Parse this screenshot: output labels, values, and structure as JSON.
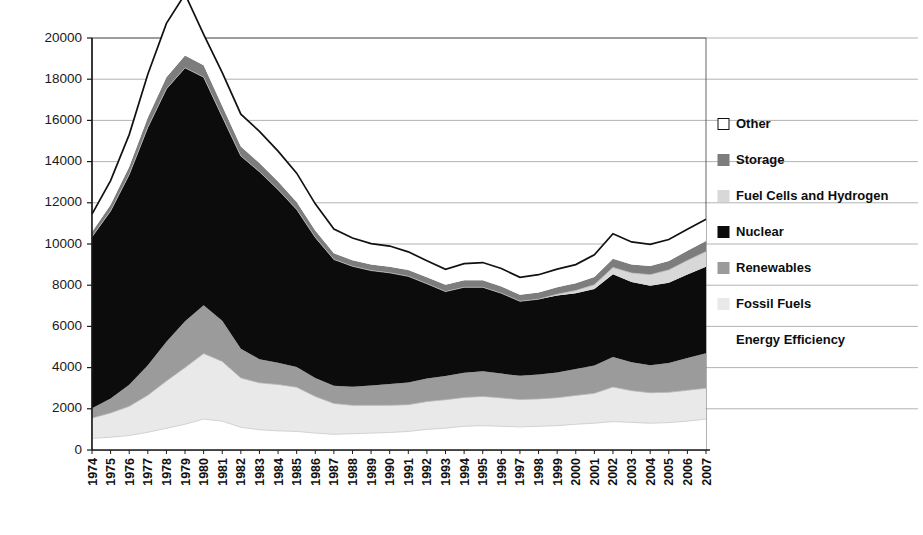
{
  "chart_data": {
    "type": "area",
    "stacked": true,
    "title": "",
    "subtitle": "",
    "xlabel": "",
    "ylabel": "",
    "xlim": [
      1974,
      2007
    ],
    "ylim": [
      0,
      20000
    ],
    "yticks": [
      0,
      2000,
      4000,
      6000,
      8000,
      10000,
      12000,
      14000,
      16000,
      18000,
      20000
    ],
    "ytick_labels": [
      "0",
      "2000",
      "4000",
      "6000",
      "8000",
      "10000",
      "12000",
      "14000",
      "16000",
      "18000",
      "20000"
    ],
    "grid": true,
    "grid_axis": "y",
    "legend_position": "right",
    "categories": [
      1974,
      1975,
      1976,
      1977,
      1978,
      1979,
      1980,
      1981,
      1982,
      1983,
      1984,
      1985,
      1986,
      1987,
      1988,
      1989,
      1990,
      1991,
      1992,
      1993,
      1994,
      1995,
      1996,
      1997,
      1998,
      1999,
      2000,
      2001,
      2002,
      2003,
      2004,
      2005,
      2006,
      2007
    ],
    "xtick_labels": [
      "1974",
      "1975",
      "1976",
      "1977",
      "1978",
      "1979",
      "1980",
      "1981",
      "1982",
      "1983",
      "1984",
      "1985",
      "1986",
      "1987",
      "1988",
      "1989",
      "1990",
      "1991",
      "1992",
      "1993",
      "1994",
      "1995",
      "1996",
      "1997",
      "1998",
      "1999",
      "2000",
      "2001",
      "2002",
      "2003",
      "2004",
      "2005",
      "2006",
      "2007"
    ],
    "stack_order_bottom_to_top": [
      "Energy Efficiency",
      "Fossil Fuels",
      "Renewables",
      "Nuclear",
      "Fuel Cells and Hydrogen",
      "Storage",
      "Other"
    ],
    "series": [
      {
        "name": "Energy Efficiency",
        "color": "#ffffff",
        "values": [
          560,
          620,
          700,
          860,
          1050,
          1250,
          1500,
          1400,
          1100,
          980,
          930,
          900,
          820,
          760,
          790,
          820,
          850,
          900,
          1000,
          1060,
          1150,
          1180,
          1150,
          1120,
          1150,
          1180,
          1250,
          1300,
          1380,
          1340,
          1300,
          1330,
          1400,
          1500
        ]
      },
      {
        "name": "Fossil Fuels",
        "color": "#e9e9e9",
        "values": [
          990,
          1180,
          1420,
          1800,
          2300,
          2750,
          3180,
          2900,
          2400,
          2280,
          2250,
          2150,
          1780,
          1500,
          1380,
          1350,
          1320,
          1300,
          1350,
          1380,
          1400,
          1420,
          1380,
          1330,
          1330,
          1360,
          1400,
          1450,
          1680,
          1540,
          1480,
          1470,
          1500,
          1500
        ]
      },
      {
        "name": "Renewables",
        "color": "#9b9b9b",
        "values": [
          480,
          700,
          1050,
          1450,
          1900,
          2250,
          2350,
          1980,
          1420,
          1150,
          1060,
          980,
          900,
          860,
          900,
          960,
          1030,
          1080,
          1120,
          1150,
          1200,
          1220,
          1180,
          1150,
          1180,
          1220,
          1280,
          1350,
          1460,
          1380,
          1340,
          1420,
          1560,
          1700
        ]
      },
      {
        "name": "Nuclear",
        "color": "#0c0c0c",
        "values": [
          8320,
          9100,
          10200,
          11550,
          12280,
          12300,
          11070,
          9900,
          9350,
          9100,
          8400,
          7650,
          6820,
          6130,
          5850,
          5580,
          5400,
          5150,
          4600,
          4100,
          4150,
          4080,
          3900,
          3620,
          3660,
          3740,
          3680,
          3720,
          4010,
          3900,
          3850,
          3900,
          4060,
          4200
        ]
      },
      {
        "name": "Fuel Cells and Hydrogen",
        "color": "#d8d8d8",
        "values": [
          0,
          0,
          0,
          0,
          0,
          0,
          0,
          0,
          0,
          0,
          0,
          0,
          0,
          0,
          0,
          0,
          0,
          0,
          0,
          0,
          0,
          0,
          0,
          0,
          0,
          60,
          130,
          200,
          330,
          430,
          540,
          620,
          680,
          730
        ]
      },
      {
        "name": "Storage",
        "color": "#7d7d7d",
        "values": [
          230,
          300,
          380,
          480,
          560,
          600,
          580,
          520,
          460,
          420,
          390,
          360,
          330,
          300,
          290,
          290,
          300,
          310,
          320,
          330,
          340,
          340,
          330,
          320,
          330,
          340,
          360,
          380,
          420,
          410,
          420,
          440,
          470,
          520
        ]
      },
      {
        "name": "Other",
        "color": "#ffffff",
        "values": [
          870,
          1180,
          1560,
          2100,
          2620,
          2980,
          1500,
          1620,
          1570,
          1540,
          1480,
          1400,
          1300,
          1180,
          1080,
          1020,
          1000,
          880,
          800,
          750,
          810,
          860,
          870,
          840,
          860,
          880,
          900,
          1080,
          1220,
          1100,
          1050,
          1040,
          1050,
          1050
        ]
      }
    ],
    "stack_totals": [
      11450,
      13080,
      15310,
      18240,
      20710,
      22130,
      21180,
      18320,
      16300,
      15470,
      14510,
      13440,
      11750,
      10830,
      10290,
      10020,
      9900,
      9620,
      9190,
      8770,
      9050,
      9100,
      8810,
      8380,
      8510,
      8780,
      8950,
      9280,
      10500,
      10100,
      9980,
      10220,
      10720,
      11200
    ]
  },
  "legend": {
    "items": [
      {
        "label": "Other",
        "swatch": "#ffffff",
        "swatch_border": "#111111",
        "swatch_visible": true
      },
      {
        "label": "Storage",
        "swatch": "#7d7d7d",
        "swatch_border": "#7d7d7d",
        "swatch_visible": true
      },
      {
        "label": "Fuel Cells and Hydrogen",
        "swatch": "#d8d8d8",
        "swatch_border": "#d8d8d8",
        "swatch_visible": true
      },
      {
        "label": "Nuclear",
        "swatch": "#0c0c0c",
        "swatch_border": "#0c0c0c",
        "swatch_visible": true
      },
      {
        "label": "Renewables",
        "swatch": "#9b9b9b",
        "swatch_border": "#9b9b9b",
        "swatch_visible": true
      },
      {
        "label": "Fossil Fuels",
        "swatch": "#e9e9e9",
        "swatch_border": "#e9e9e9",
        "swatch_visible": true
      },
      {
        "label": "Energy Efficiency",
        "swatch": "#ffffff",
        "swatch_border": "#ffffff",
        "swatch_visible": false
      }
    ]
  },
  "colors": {
    "grid": "#aaaaaa",
    "axis": "#1a1a1a",
    "outline": "#111111",
    "background": "#ffffff"
  }
}
